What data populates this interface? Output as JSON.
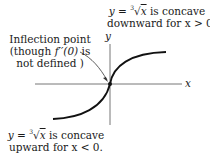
{
  "diagram": {
    "type": "function-graph",
    "function": "y = cube_root(x)",
    "axes": {
      "x_label": "x",
      "y_label": "y"
    },
    "annotations": {
      "top": {
        "line1_prefix": "y = ",
        "radicand": "x",
        "root_index": "3",
        "line1_suffix": " is concave",
        "line2": "downward for x > 0."
      },
      "inflection": {
        "line1": "Inflection point",
        "line2_prefix": "(though ",
        "line2_func": "f′′(0)",
        "line2_suffix": " is",
        "line3": "not defined )"
      },
      "bottom": {
        "line1_prefix": "y = ",
        "radicand": "x",
        "root_index": "3",
        "line1_suffix": " is concave",
        "line2": "upward for x < 0."
      }
    },
    "colors": {
      "curve": "#111111",
      "axis": "#555555",
      "text": "#1a1a1a"
    }
  }
}
